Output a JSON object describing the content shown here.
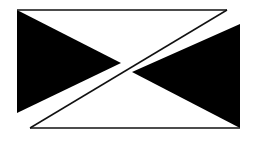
{
  "diagram": {
    "type": "geometric-figure",
    "colors": {
      "background": "#ffffff",
      "fill": "#000000",
      "stroke": "#111111"
    },
    "shapes": {
      "top_line": {
        "x1": 17,
        "y1": 10,
        "x2": 227,
        "y2": 10
      },
      "bottom_line": {
        "x1": 30,
        "y1": 128,
        "x2": 240,
        "y2": 128
      },
      "band_upper_edge": {
        "x1": 227,
        "y1": 10,
        "x2": 30,
        "y2": 128
      },
      "left_triangle": "17,10 17,113 120,64",
      "right_triangle": "240,24 240,128 130,70"
    }
  }
}
